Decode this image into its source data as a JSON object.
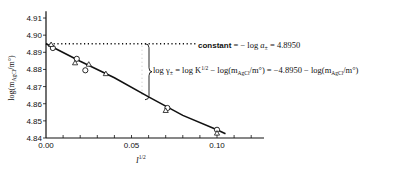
{
  "chart_data": {
    "type": "scatter",
    "title": "",
    "xlabel": "I^1/2",
    "ylabel": "log(m_AgCl/m°)",
    "xlim": [
      0.0,
      0.125
    ],
    "ylim": [
      4.84,
      4.915
    ],
    "grid": false,
    "x_ticks": [
      "0.00",
      "0.05",
      "0.10"
    ],
    "y_ticks": [
      "4.84",
      "4.85",
      "4.86",
      "4.87",
      "4.88",
      "4.89",
      "4.90",
      "4.91"
    ],
    "series": [
      {
        "name": "circles",
        "marker": "circle",
        "points": [
          [
            0.004,
            4.8925
          ],
          [
            0.018,
            4.8862
          ],
          [
            0.023,
            4.8795
          ],
          [
            0.071,
            4.8575
          ],
          [
            0.1,
            4.8448
          ]
        ]
      },
      {
        "name": "triangles",
        "marker": "triangle",
        "points": [
          [
            0.003,
            4.8945
          ],
          [
            0.017,
            4.8838
          ],
          [
            0.025,
            4.883
          ],
          [
            0.035,
            4.8775
          ],
          [
            0.07,
            4.856
          ],
          [
            0.1,
            4.8428
          ]
        ]
      },
      {
        "name": "fit-curve",
        "marker": "line",
        "points": [
          [
            0.0,
            4.895
          ],
          [
            0.02,
            4.8848
          ],
          [
            0.04,
            4.8752
          ],
          [
            0.06,
            4.864
          ],
          [
            0.08,
            4.8532
          ],
          [
            0.1,
            4.8448
          ],
          [
            0.105,
            4.8425
          ]
        ]
      }
    ],
    "reference_line": {
      "y": 4.895,
      "style": "dotted",
      "x_from": 0.0,
      "x_to": 0.058
    },
    "annotations": [
      {
        "text": "constant = − log a± = 4.8950"
      },
      {
        "text": "log γ± = log K^1/2 − log(m_AgCl/m°) = −4.8950 − log(m_AgCl/m°)"
      }
    ]
  },
  "labels": {
    "ylabel_main": "log(m",
    "ylabel_sub": "AgCl",
    "ylabel_tail": "/m°)",
    "xlabel_main": "I",
    "xlabel_sup": "1/2",
    "const_word": "constant",
    "const_eq": " =  − log ",
    "const_a": "a",
    "const_pm": "±",
    "const_val": " = 4.8950",
    "gamma_log": "log γ",
    "gamma_pm": "±",
    "gamma_mid": " = log K",
    "gamma_sup": "1/2",
    "gamma_rest1": " − log(m",
    "gamma_sub1": "AgCl",
    "gamma_rest2": "/m°)  =  −4.8950  −  log(m",
    "gamma_sub2": "AgCl",
    "gamma_rest3": "/m°)"
  }
}
